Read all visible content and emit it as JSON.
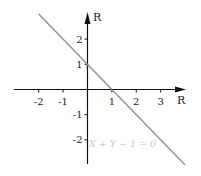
{
  "chart_data": {
    "type": "line",
    "title": "",
    "xlabel": "R",
    "ylabel": "R",
    "xlim": [
      -3.2,
      4.0
    ],
    "ylim": [
      -3.2,
      3.2
    ],
    "grid": false,
    "x_ticks": [
      -2,
      -1,
      1,
      2,
      3
    ],
    "y_ticks": [
      2,
      1,
      -1,
      -2
    ],
    "x_tick_labels": [
      "-2",
      "-1",
      "1",
      "2",
      "3"
    ],
    "y_tick_labels": [
      "2",
      "1",
      "-1",
      "-2"
    ],
    "series": [
      {
        "name": "X + Y − 1 = 0",
        "x": [
          -2.0,
          4.0
        ],
        "y": [
          3.0,
          -3.0
        ],
        "color": "#909090"
      }
    ],
    "annotations": [
      {
        "text": "X + Y − 1 = 0",
        "x": 0.05,
        "y": -2.1,
        "color": "#c8c8c8"
      }
    ]
  },
  "colors": {
    "axis": "#111111",
    "line": "#909090",
    "annotation": "#c8c8c8"
  }
}
